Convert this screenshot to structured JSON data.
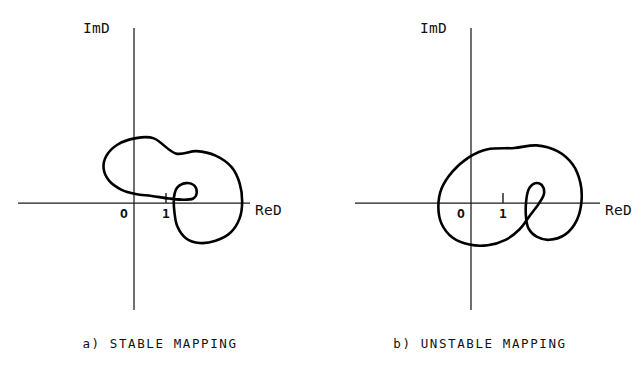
{
  "figure": {
    "background_color": "#ffffff",
    "stroke_color": "#000000",
    "axis_color": "#1a1a1a"
  },
  "panels": [
    {
      "id": "a",
      "caption": "a) STABLE MAPPING",
      "imaginary_axis_label": "ImD",
      "real_axis_label": "ReD",
      "origin_label": "O",
      "unit_tick_label": "1"
    },
    {
      "id": "b",
      "caption": "b) UNSTABLE MAPPING",
      "imaginary_axis_label": "ImD",
      "real_axis_label": "ReD",
      "origin_label": "O",
      "unit_tick_label": "1"
    }
  ],
  "chart_data": [
    {
      "type": "line",
      "title": "a) STABLE MAPPING",
      "xlabel": "ReD",
      "ylabel": "ImD",
      "grid": false,
      "legend": "none",
      "xlim": [
        -1.2,
        4.2
      ],
      "ylim": [
        -1.6,
        2.6
      ],
      "annotations": [
        {
          "text": "O",
          "x": 0,
          "y": 0,
          "role": "origin-marker"
        },
        {
          "text": "1",
          "x": 1,
          "y": 0,
          "role": "unit-point-marker"
        }
      ],
      "description": "Closed Nyquist-type contour with a large outer loop and a small inner loop near ReD=1; the small loop does not encircle the critical point 1, indicating stability.",
      "series": [
        {
          "name": "D-mapping contour (stable)",
          "closed": true,
          "encircles_critical_point": false,
          "critical_point": [
            1,
            0
          ],
          "points": [
            [
              1.3,
              1.55
            ],
            [
              1.95,
              1.62
            ],
            [
              2.55,
              1.48
            ],
            [
              3.05,
              1.12
            ],
            [
              3.3,
              0.62
            ],
            [
              3.38,
              0.05
            ],
            [
              3.3,
              -0.48
            ],
            [
              3.02,
              -0.92
            ],
            [
              2.55,
              -1.18
            ],
            [
              2.05,
              -1.25
            ],
            [
              1.62,
              -1.1
            ],
            [
              1.35,
              -0.72
            ],
            [
              1.26,
              -0.25
            ],
            [
              1.25,
              0.18
            ],
            [
              1.35,
              0.48
            ],
            [
              1.62,
              0.62
            ],
            [
              1.88,
              0.55
            ],
            [
              1.96,
              0.32
            ],
            [
              1.85,
              0.14
            ],
            [
              1.55,
              0.1
            ],
            [
              1.1,
              0.14
            ],
            [
              0.55,
              0.22
            ],
            [
              0.05,
              0.28
            ],
            [
              -0.4,
              0.42
            ],
            [
              -0.78,
              0.7
            ],
            [
              -0.95,
              1.08
            ],
            [
              -0.86,
              1.48
            ],
            [
              -0.52,
              1.82
            ],
            [
              0.02,
              2.02
            ],
            [
              0.62,
              2.02
            ],
            [
              1.3,
              1.55
            ]
          ]
        }
      ]
    },
    {
      "type": "line",
      "title": "b) UNSTABLE MAPPING",
      "xlabel": "ReD",
      "ylabel": "ImD",
      "grid": false,
      "legend": "none",
      "xlim": [
        -1.2,
        4.2
      ],
      "ylim": [
        -1.6,
        2.6
      ],
      "annotations": [
        {
          "text": "O",
          "x": 0,
          "y": 0,
          "role": "origin-marker"
        },
        {
          "text": "1",
          "x": 1,
          "y": 0,
          "role": "unit-point-marker"
        }
      ],
      "description": "Closed Nyquist-type contour whose self-crossing forms an inner loop that encircles the critical point ReD=1, indicating instability.",
      "series": [
        {
          "name": "D-mapping contour (unstable)",
          "closed": true,
          "encircles_critical_point": true,
          "critical_point": [
            1,
            0
          ],
          "self_intersection": [
            1.75,
            -0.75
          ],
          "points": [
            [
              1.35,
              1.72
            ],
            [
              2.05,
              1.8
            ],
            [
              2.7,
              1.62
            ],
            [
              3.18,
              1.2
            ],
            [
              3.42,
              0.62
            ],
            [
              3.45,
              0.02
            ],
            [
              3.3,
              -0.55
            ],
            [
              2.95,
              -0.98
            ],
            [
              2.45,
              -1.15
            ],
            [
              2.05,
              -1.05
            ],
            [
              1.8,
              -0.8
            ],
            [
              1.72,
              -0.45
            ],
            [
              1.72,
              0.02
            ],
            [
              1.8,
              0.42
            ],
            [
              2.0,
              0.62
            ],
            [
              2.22,
              0.55
            ],
            [
              2.28,
              0.28
            ],
            [
              2.12,
              -0.02
            ],
            [
              1.82,
              -0.42
            ],
            [
              1.52,
              -0.82
            ],
            [
              1.08,
              -1.15
            ],
            [
              0.52,
              -1.32
            ],
            [
              -0.05,
              -1.3
            ],
            [
              -0.58,
              -1.08
            ],
            [
              -0.92,
              -0.65
            ],
            [
              -1.02,
              -0.12
            ],
            [
              -0.92,
              0.45
            ],
            [
              -0.58,
              0.98
            ],
            [
              -0.08,
              1.42
            ],
            [
              0.52,
              1.68
            ],
            [
              1.35,
              1.72
            ]
          ]
        }
      ]
    }
  ]
}
